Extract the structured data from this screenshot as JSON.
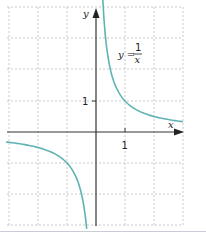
{
  "chart_data": {
    "type": "line",
    "title": "",
    "function_label": {
      "lhs": "y =",
      "numerator": "1",
      "denominator": "x"
    },
    "xlabel": "x",
    "ylabel": "y",
    "x_ticks": [
      {
        "value": 1,
        "label": "1"
      }
    ],
    "y_ticks": [
      {
        "value": 1,
        "label": "1"
      }
    ],
    "xlim": [
      -3.1,
      3.0
    ],
    "ylim": [
      -3.1,
      4.3
    ],
    "grid": true,
    "grid_step": 1,
    "series": [
      {
        "name": "y = 1/x (x > 0)",
        "color": "#5fb3b3",
        "x": [
          0.23,
          0.3,
          0.4,
          0.5,
          0.75,
          1,
          1.5,
          2,
          2.5,
          3.0
        ],
        "y": [
          4.35,
          3.33,
          2.5,
          2.0,
          1.33,
          1.0,
          0.67,
          0.5,
          0.4,
          0.33
        ]
      },
      {
        "name": "y = 1/x (x < 0)",
        "color": "#5fb3b3",
        "x": [
          -3.1,
          -2.5,
          -2,
          -1.5,
          -1,
          -0.75,
          -0.5,
          -0.4,
          -0.32
        ],
        "y": [
          -0.32,
          -0.4,
          -0.5,
          -0.67,
          -1.0,
          -1.33,
          -2.0,
          -2.5,
          -3.1
        ]
      }
    ]
  },
  "colors": {
    "curve": "#5fb3b3",
    "axis": "#333333",
    "grid": "#c8c8c8"
  }
}
